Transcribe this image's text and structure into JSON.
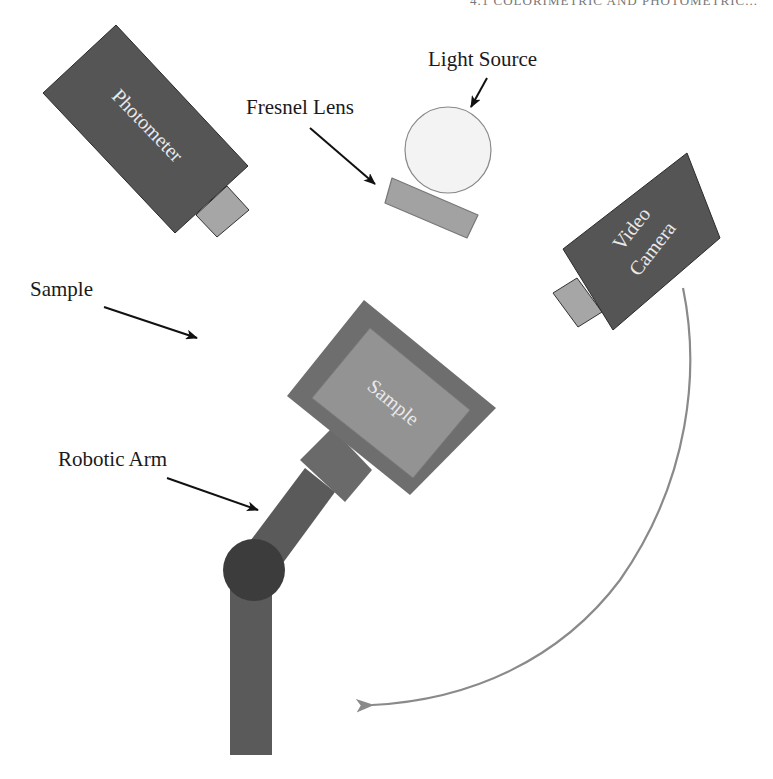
{
  "header": {
    "cropped_title": "4.1 COLORIMETRIC AND PHOTOMETRIC..."
  },
  "labels": {
    "light_source": "Light Source",
    "fresnel_lens": "Fresnel Lens",
    "sample": "Sample",
    "robotic_arm": "Robotic Arm"
  },
  "components": {
    "photometer": "Photometer",
    "video_camera_line1": "Video",
    "video_camera_line2": "Camera",
    "sample_plate": "Sample"
  },
  "colors": {
    "dark_body": "#555555",
    "lens_gray": "#9e9e9e",
    "holder_frame": "#6e6e6e",
    "sample_face": "#939393",
    "arm": "#5a5a5a",
    "joint": "#3c3c3c",
    "light_bulb": "#f3f3f3",
    "motion_arc": "#8a8a8a",
    "arrow": "#111111"
  }
}
